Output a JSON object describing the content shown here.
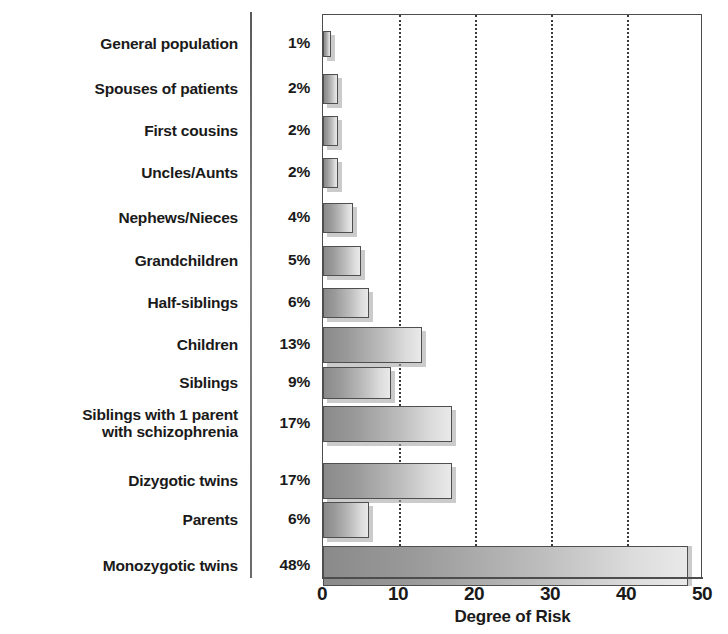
{
  "chart_data": {
    "type": "bar",
    "orientation": "horizontal",
    "title": "",
    "xlabel": "Degree of Risk",
    "ylabel": "",
    "xlim": [
      0,
      50
    ],
    "xticks": [
      0,
      10,
      20,
      30,
      40,
      50
    ],
    "gridlines": [
      10,
      20,
      30,
      40
    ],
    "grid": "vertical-dotted",
    "legend": "none",
    "value_unit": "%",
    "categories": [
      "General population",
      "Spouses of patients",
      "First cousins",
      "Uncles/Aunts",
      "Nephews/Nieces",
      "Grandchildren",
      "Half-siblings",
      "Children",
      "Siblings",
      "Siblings with 1 parent with schizophrenia",
      "Dizygotic twins",
      "Parents",
      "Monozygotic twins"
    ],
    "values": [
      1,
      2,
      2,
      2,
      4,
      5,
      6,
      13,
      9,
      17,
      17,
      6,
      48
    ],
    "value_labels": [
      "1%",
      "2%",
      "2%",
      "2%",
      "4%",
      "5%",
      "6%",
      "13%",
      "9%",
      "17%",
      "17%",
      "6%",
      "48%"
    ]
  },
  "rows": [
    {
      "label_lines": [
        "General population"
      ],
      "value_label": "1%",
      "value": 1
    },
    {
      "label_lines": [
        "Spouses of patients"
      ],
      "value_label": "2%",
      "value": 2
    },
    {
      "label_lines": [
        "First cousins"
      ],
      "value_label": "2%",
      "value": 2
    },
    {
      "label_lines": [
        "Uncles/Aunts"
      ],
      "value_label": "2%",
      "value": 2
    },
    {
      "label_lines": [
        "Nephews/Nieces"
      ],
      "value_label": "4%",
      "value": 4
    },
    {
      "label_lines": [
        "Grandchildren"
      ],
      "value_label": "5%",
      "value": 5
    },
    {
      "label_lines": [
        "Half-siblings"
      ],
      "value_label": "6%",
      "value": 6
    },
    {
      "label_lines": [
        "Children"
      ],
      "value_label": "13%",
      "value": 13
    },
    {
      "label_lines": [
        "Siblings"
      ],
      "value_label": "9%",
      "value": 9
    },
    {
      "label_lines": [
        "Siblings with 1 parent",
        "with schizophrenia"
      ],
      "value_label": "17%",
      "value": 17
    },
    {
      "label_lines": [
        "Dizygotic twins"
      ],
      "value_label": "17%",
      "value": 17
    },
    {
      "label_lines": [
        "Parents"
      ],
      "value_label": "6%",
      "value": 6
    },
    {
      "label_lines": [
        "Monozygotic twins"
      ],
      "value_label": "48%",
      "value": 48
    }
  ],
  "axis": {
    "title": "Degree of Risk",
    "ticks": [
      "0",
      "10",
      "20",
      "30",
      "40",
      "50"
    ],
    "tick_values": [
      0,
      10,
      20,
      30,
      40,
      50
    ],
    "max": 50
  },
  "colors": {
    "bar_dark": "#8a8a8a",
    "bar_light": "#e9e9e9",
    "bar_border": "#4f4f4f",
    "axis": "#4d4d4d",
    "grid": "#3a3a3a",
    "text": "#1a1a1a",
    "background": "#ffffff",
    "shadow": "#a0a0a0"
  }
}
